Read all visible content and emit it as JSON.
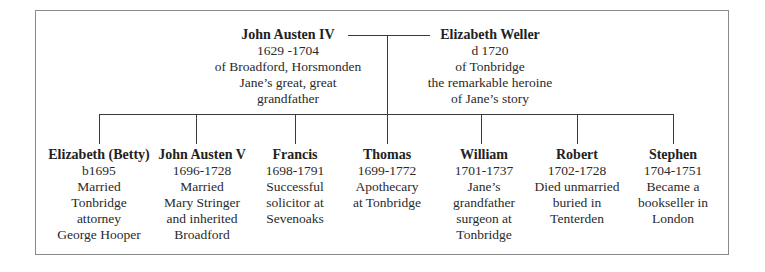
{
  "parents": {
    "father": {
      "name": "John Austen IV",
      "lines": [
        "1629 -1704",
        "of Broadford, Horsmonden",
        "Jane’s great, great",
        "grandfather"
      ]
    },
    "mother": {
      "name": "Elizabeth Weller",
      "lines": [
        "d 1720",
        "of Tonbridge",
        "the remarkable heroine",
        "of Jane’s story"
      ]
    }
  },
  "children": [
    {
      "name": "Elizabeth (Betty)",
      "lines": [
        "b1695",
        "Married",
        "Tonbridge",
        "attorney",
        "George Hooper"
      ]
    },
    {
      "name": "John Austen V",
      "lines": [
        "1696-1728",
        "Married",
        "Mary Stringer",
        "and inherited",
        "Broadford"
      ]
    },
    {
      "name": "Francis",
      "lines": [
        "1698-1791",
        "Successful",
        "solicitor at",
        "Sevenoaks"
      ]
    },
    {
      "name": "Thomas",
      "lines": [
        "1699-1772",
        "Apothecary",
        "at Tonbridge"
      ]
    },
    {
      "name": "William",
      "lines": [
        "1701-1737",
        "Jane’s",
        "grandfather",
        "surgeon at",
        "Tonbridge"
      ]
    },
    {
      "name": "Robert",
      "lines": [
        "1702-1728",
        "Died unmarried",
        "buried in",
        "Tenterden"
      ]
    },
    {
      "name": "Stephen",
      "lines": [
        "1704-1751",
        "Became a",
        "bookseller in",
        "London"
      ]
    }
  ],
  "colors": {
    "line": "#3a3a3a",
    "border": "#8a8a8a",
    "text": "#2a2a2a"
  }
}
